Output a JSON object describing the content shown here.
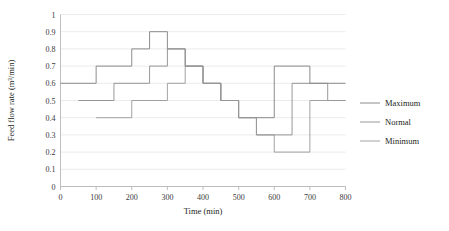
{
  "chart_data": {
    "type": "line",
    "title": "",
    "xlabel": "Time (min)",
    "ylabel": "Feed flow rate (m³/min)",
    "xlim": [
      0,
      800
    ],
    "ylim": [
      0,
      1
    ],
    "xticks": [
      "0",
      "100",
      "200",
      "300",
      "400",
      "500",
      "600",
      "700",
      "800"
    ],
    "yticks": [
      "0",
      "0.1",
      "0.2",
      "0.3",
      "0.4",
      "0.5",
      "0.6",
      "0.7",
      "0.8",
      "0.9",
      "1"
    ],
    "grid": "horizontal",
    "legend_position": "right",
    "step_style": "post",
    "series": [
      {
        "name": "Maximum",
        "color": "#808080",
        "x": [
          0,
          100,
          200,
          250,
          300,
          350,
          400,
          450,
          500,
          600,
          700,
          800
        ],
        "values": [
          0.6,
          0.7,
          0.8,
          0.9,
          0.8,
          0.7,
          0.6,
          0.5,
          0.4,
          0.7,
          0.6,
          0.6
        ]
      },
      {
        "name": "Normal",
        "color": "#8c8c8c",
        "x": [
          0,
          100,
          200,
          250,
          300,
          350,
          400,
          450,
          500,
          600,
          700,
          800
        ],
        "values": [
          0.5,
          0.6,
          0.7,
          0.8,
          0.7,
          0.6,
          0.5,
          0.4,
          0.3,
          0.6,
          0.5,
          0.5
        ],
        "offset_note": "drawn 50 min right of Maximum"
      },
      {
        "name": "Minimum",
        "color": "#999999",
        "x": [
          0,
          100,
          200,
          250,
          300,
          350,
          400,
          450,
          500,
          600,
          700,
          800
        ],
        "values": [
          0.4,
          0.5,
          0.6,
          0.7,
          0.6,
          0.5,
          0.4,
          0.3,
          0.2,
          0.5,
          0.4,
          0.4
        ],
        "offset_note": "drawn 100 min right of Maximum"
      }
    ]
  },
  "legend": {
    "items": [
      {
        "label": "Maximum",
        "color": "#808080"
      },
      {
        "label": "Normal",
        "color": "#8c8c8c"
      },
      {
        "label": "Minimum",
        "color": "#999999"
      }
    ]
  },
  "axes": {
    "y_axis_title": "Feed flow rate (m³/min)",
    "x_axis_title": "Time (min)"
  }
}
